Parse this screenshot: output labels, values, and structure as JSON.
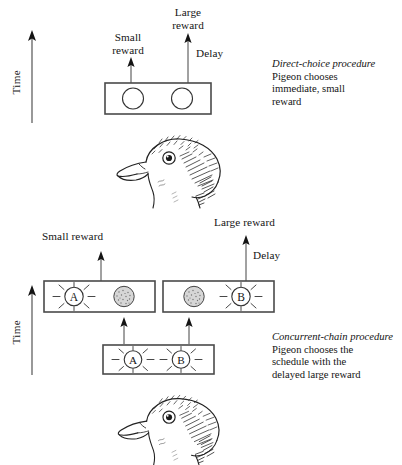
{
  "figure": {
    "title_alt": "Direct-choice and concurrent-chain procedures with pigeon",
    "ink_color": "#141414",
    "box_fill": "#ffffff",
    "key_fill": "#d9d9d9"
  },
  "top_panel": {
    "time_axis_label": "Time",
    "small_reward_label": "Small\nreward",
    "large_reward_label": "Large\nreward",
    "delay_label": "Delay",
    "chamber": {
      "name": "direct-choice-chamber",
      "keys": [
        {
          "id": "left-key",
          "label": "",
          "style": "open-circle"
        },
        {
          "id": "right-key",
          "label": "",
          "style": "open-circle"
        }
      ]
    },
    "caption_title": "Direct-choice procedure",
    "caption_body": "Pigeon chooses\nimmediate, small\nreward",
    "subject": "pigeon-head"
  },
  "bottom_panel": {
    "time_axis_label": "Time",
    "small_reward_label": "Small reward",
    "large_reward_label": "Large reward",
    "delay_label": "Delay",
    "terminal_left_chamber": {
      "name": "terminal-link-left-chamber",
      "keys": [
        {
          "id": "key-a-lit",
          "label": "A",
          "style": "lit-key"
        },
        {
          "id": "key-dark-right",
          "label": "",
          "style": "dark-key"
        }
      ]
    },
    "terminal_right_chamber": {
      "name": "terminal-link-right-chamber",
      "keys": [
        {
          "id": "key-dark-left",
          "label": "",
          "style": "dark-key"
        },
        {
          "id": "key-b-lit",
          "label": "B",
          "style": "lit-key"
        }
      ]
    },
    "initial_chamber": {
      "name": "initial-link-chamber",
      "keys": [
        {
          "id": "initial-key-a",
          "label": "A",
          "style": "lit-key"
        },
        {
          "id": "initial-key-b",
          "label": "B",
          "style": "lit-key"
        }
      ]
    },
    "caption_title": "Concurrent-chain procedure",
    "caption_body": "Pigeon chooses the\nschedule with the\ndelayed large reward",
    "subject": "pigeon-head"
  }
}
